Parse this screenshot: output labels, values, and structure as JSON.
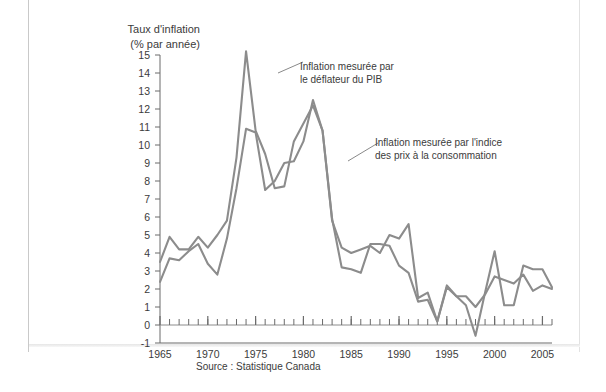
{
  "axis_title": "Taux d'inflation\n(% par année)",
  "source_note": "Source : Statistique Canada",
  "annotations": {
    "deflator": "Inflation mesurée par\nle déflateur du PIB",
    "cpi": "Inflation mesurée par l'indice\ndes prix à la consommation"
  },
  "colors": {
    "line": "#8c8c8c",
    "axis": "#6b6b6b",
    "text": "#3b3b3b",
    "frame": "#c9c9c9",
    "background": "#ffffff"
  },
  "chart_data": {
    "type": "line",
    "title": "",
    "xlabel": "",
    "ylabel": "Taux d'inflation (% par année)",
    "xlim": [
      1965,
      2006
    ],
    "ylim": [
      -1,
      15
    ],
    "ytick_labels": [
      "15",
      "14",
      "13",
      "12",
      "11",
      "10",
      "9",
      "8",
      "7",
      "6",
      "5",
      "4",
      "3",
      "2",
      "1",
      "0",
      "-1"
    ],
    "ytick_values": [
      15,
      14,
      13,
      12,
      11,
      10,
      9,
      8,
      7,
      6,
      5,
      4,
      3,
      2,
      1,
      0,
      -1
    ],
    "xtick_labels": [
      "1965",
      "1970",
      "1975",
      "1980",
      "1985",
      "1990",
      "1995",
      "2000",
      "2005"
    ],
    "xtick_values": [
      1965,
      1970,
      1975,
      1980,
      1985,
      1990,
      1995,
      2000,
      2005
    ],
    "minor_tick_interval": 1,
    "grid": false,
    "legend_position": "inline-annotations",
    "x": [
      1965,
      1966,
      1967,
      1968,
      1969,
      1970,
      1971,
      1972,
      1973,
      1974,
      1975,
      1976,
      1977,
      1978,
      1979,
      1980,
      1981,
      1982,
      1983,
      1984,
      1985,
      1986,
      1987,
      1988,
      1989,
      1990,
      1991,
      1992,
      1993,
      1994,
      1995,
      1996,
      1997,
      1998,
      1999,
      2000,
      2001,
      2002,
      2003,
      2004,
      2005,
      2006
    ],
    "series": [
      {
        "name": "Inflation mesurée par le déflateur du PIB",
        "values": [
          3.5,
          4.9,
          4.2,
          4.2,
          4.9,
          4.3,
          5.0,
          5.8,
          9.3,
          15.2,
          10.8,
          9.5,
          7.6,
          7.7,
          10.2,
          11.2,
          12.2,
          10.8,
          5.9,
          3.2,
          3.1,
          2.9,
          4.5,
          4.5,
          4.4,
          3.3,
          2.9,
          1.3,
          1.4,
          0.2,
          2.1,
          1.6,
          1.1,
          -0.6,
          1.8,
          4.1,
          1.1,
          1.1,
          3.3,
          3.1,
          3.1,
          2.1
        ]
      },
      {
        "name": "Inflation mesurée par l'indice des prix à la consommation",
        "values": [
          2.4,
          3.7,
          3.6,
          4.1,
          4.5,
          3.4,
          2.8,
          4.8,
          7.6,
          10.9,
          10.7,
          7.5,
          8.0,
          9.0,
          9.1,
          10.2,
          12.5,
          10.8,
          5.8,
          4.3,
          4.0,
          4.2,
          4.4,
          4.0,
          5.0,
          4.8,
          5.6,
          1.5,
          1.8,
          0.2,
          2.2,
          1.6,
          1.6,
          1.0,
          1.7,
          2.7,
          2.5,
          2.3,
          2.8,
          1.9,
          2.2,
          2.0
        ]
      }
    ]
  }
}
